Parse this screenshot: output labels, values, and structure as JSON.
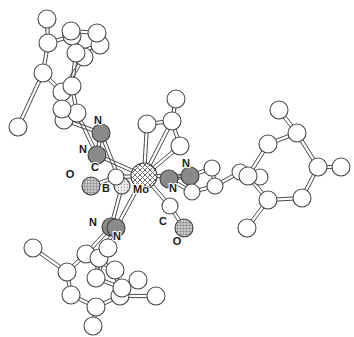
{
  "figure": {
    "kind": "molecular-structure-diagram",
    "style": "ball-and-stick crystal structure",
    "background_color": "#ffffff",
    "bond_color": "#4a4a4a",
    "width": 354,
    "height": 337
  },
  "legend": {
    "atom_types": [
      {
        "element": "Mo",
        "fill_pattern": "cross-hatch",
        "color": "#ffffff",
        "radius": 13
      },
      {
        "element": "N",
        "fill_pattern": "solid",
        "color": "#8a8a8a",
        "radius": 9
      },
      {
        "element": "O",
        "fill_pattern": "fine-grid",
        "color": "#b0b0b0",
        "radius": 9
      },
      {
        "element": "B",
        "fill_pattern": "stipple",
        "color": "#dcdcdc",
        "radius": 8
      },
      {
        "element": "C",
        "fill_pattern": "open",
        "color": "#ffffff",
        "radius": 8
      }
    ]
  },
  "labels": [
    {
      "id": "lbl-n-top-a",
      "text": "N",
      "x": 98,
      "y": 124
    },
    {
      "id": "lbl-n-top-b",
      "text": "N",
      "x": 83,
      "y": 153
    },
    {
      "id": "lbl-o-left",
      "text": "O",
      "x": 70,
      "y": 178
    },
    {
      "id": "lbl-c-left",
      "text": "C",
      "x": 95,
      "y": 171
    },
    {
      "id": "lbl-b-boron",
      "text": "B",
      "x": 106,
      "y": 192
    },
    {
      "id": "lbl-mo-center",
      "text": "Mo",
      "x": 141,
      "y": 193
    },
    {
      "id": "lbl-n-right-a",
      "text": "N",
      "x": 186,
      "y": 167
    },
    {
      "id": "lbl-n-right-b",
      "text": "N",
      "x": 173,
      "y": 192
    },
    {
      "id": "lbl-n-bot-a",
      "text": "N",
      "x": 93,
      "y": 226
    },
    {
      "id": "lbl-n-bot-b",
      "text": "N",
      "x": 117,
      "y": 240
    },
    {
      "id": "lbl-c-bot",
      "text": "C",
      "x": 163,
      "y": 225
    },
    {
      "id": "lbl-o-bot",
      "text": "O",
      "x": 177,
      "y": 245
    }
  ],
  "atoms": [
    {
      "id": "Mo1",
      "el": "Mo",
      "x": 144,
      "y": 176,
      "r": 13
    },
    {
      "id": "B1",
      "el": "B",
      "x": 122,
      "y": 186,
      "r": 8
    },
    {
      "id": "N1",
      "el": "N",
      "x": 101,
      "y": 133,
      "r": 9
    },
    {
      "id": "N2",
      "el": "N",
      "x": 97,
      "y": 155,
      "r": 9
    },
    {
      "id": "N3",
      "el": "N",
      "x": 169,
      "y": 179,
      "r": 9
    },
    {
      "id": "N4",
      "el": "N",
      "x": 190,
      "y": 176,
      "r": 9
    },
    {
      "id": "N5",
      "el": "N",
      "x": 111,
      "y": 227,
      "r": 9
    },
    {
      "id": "N6",
      "el": "N",
      "x": 116,
      "y": 228,
      "r": 9
    },
    {
      "id": "C10",
      "el": "C",
      "x": 116,
      "y": 177,
      "r": 8
    },
    {
      "id": "O10",
      "el": "O",
      "x": 91,
      "y": 186,
      "r": 9
    },
    {
      "id": "C11",
      "el": "C",
      "x": 170,
      "y": 206,
      "r": 8
    },
    {
      "id": "O11",
      "el": "O",
      "x": 184,
      "y": 228,
      "r": 9
    },
    {
      "id": "Ca1",
      "el": "C",
      "x": 147,
      "y": 124,
      "r": 9
    },
    {
      "id": "Ca2",
      "el": "C",
      "x": 172,
      "y": 121,
      "r": 9
    },
    {
      "id": "Ca3",
      "el": "C",
      "x": 180,
      "y": 146,
      "r": 9
    },
    {
      "id": "Ca4",
      "el": "C",
      "x": 176,
      "y": 99,
      "r": 9
    },
    {
      "id": "Cr1",
      "el": "C",
      "x": 192,
      "y": 192,
      "r": 8
    },
    {
      "id": "Cr2",
      "el": "C",
      "x": 215,
      "y": 186,
      "r": 8
    },
    {
      "id": "Cr3",
      "el": "C",
      "x": 212,
      "y": 168,
      "r": 8
    },
    {
      "id": "Cr4",
      "el": "C",
      "x": 240,
      "y": 172,
      "r": 8
    },
    {
      "id": "Cr5",
      "el": "C",
      "x": 260,
      "y": 177,
      "r": 8
    },
    {
      "id": "Pr1",
      "el": "C",
      "x": 268,
      "y": 144,
      "r": 9
    },
    {
      "id": "Pr2",
      "el": "C",
      "x": 297,
      "y": 133,
      "r": 9
    },
    {
      "id": "Pr3",
      "el": "C",
      "x": 318,
      "y": 167,
      "r": 9
    },
    {
      "id": "Pr4",
      "el": "C",
      "x": 302,
      "y": 198,
      "r": 9
    },
    {
      "id": "Pr5",
      "el": "C",
      "x": 268,
      "y": 200,
      "r": 9
    },
    {
      "id": "Pr6",
      "el": "C",
      "x": 248,
      "y": 176,
      "r": 9
    },
    {
      "id": "Pr7",
      "el": "C",
      "x": 279,
      "y": 110,
      "r": 9
    },
    {
      "id": "Pr8",
      "el": "C",
      "x": 341,
      "y": 167,
      "r": 9
    },
    {
      "id": "Pr9",
      "el": "C",
      "x": 247,
      "y": 228,
      "r": 9
    },
    {
      "id": "Pt1",
      "el": "C",
      "x": 64,
      "y": 120,
      "r": 9
    },
    {
      "id": "Pt2",
      "el": "C",
      "x": 62,
      "y": 92,
      "r": 9
    },
    {
      "id": "Pt3",
      "el": "C",
      "x": 43,
      "y": 73,
      "r": 9
    },
    {
      "id": "Pt4",
      "el": "C",
      "x": 48,
      "y": 43,
      "r": 9
    },
    {
      "id": "Pt5",
      "el": "C",
      "x": 72,
      "y": 36,
      "r": 9
    },
    {
      "id": "Pt6",
      "el": "C",
      "x": 84,
      "y": 57,
      "r": 9
    },
    {
      "id": "Pt7",
      "el": "C",
      "x": 47,
      "y": 19,
      "r": 9
    },
    {
      "id": "Pt8",
      "el": "C",
      "x": 18,
      "y": 127,
      "r": 9
    },
    {
      "id": "Ps1",
      "el": "C",
      "x": 77,
      "y": 113,
      "r": 9
    },
    {
      "id": "Ps2",
      "el": "C",
      "x": 72,
      "y": 86,
      "r": 9
    },
    {
      "id": "Ps3",
      "el": "C",
      "x": 76,
      "y": 53,
      "r": 9
    },
    {
      "id": "Ps4",
      "el": "C",
      "x": 100,
      "y": 45,
      "r": 9
    },
    {
      "id": "Ps5",
      "el": "C",
      "x": 71,
      "y": 31,
      "r": 9
    },
    {
      "id": "Ps6",
      "el": "C",
      "x": 97,
      "y": 33,
      "r": 9
    },
    {
      "id": "Ps7",
      "el": "C",
      "x": 62,
      "y": 109,
      "r": 9
    },
    {
      "id": "Pb1",
      "el": "C",
      "x": 86,
      "y": 254,
      "r": 9
    },
    {
      "id": "Pb2",
      "el": "C",
      "x": 67,
      "y": 272,
      "r": 9
    },
    {
      "id": "Pb3",
      "el": "C",
      "x": 71,
      "y": 295,
      "r": 9
    },
    {
      "id": "Pb4",
      "el": "C",
      "x": 96,
      "y": 307,
      "r": 9
    },
    {
      "id": "Pb5",
      "el": "C",
      "x": 120,
      "y": 296,
      "r": 9
    },
    {
      "id": "Pb6",
      "el": "C",
      "x": 115,
      "y": 270,
      "r": 9
    },
    {
      "id": "Pb7",
      "el": "C",
      "x": 33,
      "y": 248,
      "r": 9
    },
    {
      "id": "Pb8",
      "el": "C",
      "x": 93,
      "y": 326,
      "r": 9
    },
    {
      "id": "Pb9",
      "el": "C",
      "x": 156,
      "y": 296,
      "r": 9
    },
    {
      "id": "Pc1",
      "el": "C",
      "x": 99,
      "y": 258,
      "r": 9
    },
    {
      "id": "Pc2",
      "el": "C",
      "x": 96,
      "y": 278,
      "r": 9
    },
    {
      "id": "Pc3",
      "el": "C",
      "x": 122,
      "y": 288,
      "r": 9
    },
    {
      "id": "Pc4",
      "el": "C",
      "x": 138,
      "y": 280,
      "r": 9
    },
    {
      "id": "Pc5",
      "el": "C",
      "x": 108,
      "y": 248,
      "r": 9
    }
  ],
  "bonds": [
    [
      "Mo1",
      "N2"
    ],
    [
      "Mo1",
      "N4"
    ],
    [
      "Mo1",
      "N6"
    ],
    [
      "Mo1",
      "C10"
    ],
    [
      "Mo1",
      "C11"
    ],
    [
      "Mo1",
      "Ca1"
    ],
    [
      "Mo1",
      "Ca2"
    ],
    [
      "Mo1",
      "Ca3"
    ],
    [
      "B1",
      "N1"
    ],
    [
      "B1",
      "N5"
    ],
    [
      "B1",
      "C10"
    ],
    [
      "N1",
      "N2"
    ],
    [
      "N3",
      "N4"
    ],
    [
      "N5",
      "N6"
    ],
    [
      "C10",
      "O10"
    ],
    [
      "C11",
      "O11"
    ],
    [
      "Ca1",
      "Ca2"
    ],
    [
      "Ca2",
      "Ca3"
    ],
    [
      "Ca2",
      "Ca4"
    ],
    [
      "N3",
      "Cr1"
    ],
    [
      "N4",
      "Cr3"
    ],
    [
      "Cr1",
      "Cr2"
    ],
    [
      "Cr2",
      "Cr3"
    ],
    [
      "Cr2",
      "Cr4"
    ],
    [
      "Cr4",
      "Cr5"
    ],
    [
      "Cr5",
      "Pr6"
    ],
    [
      "Pr1",
      "Pr2"
    ],
    [
      "Pr2",
      "Pr3"
    ],
    [
      "Pr3",
      "Pr4"
    ],
    [
      "Pr4",
      "Pr5"
    ],
    [
      "Pr5",
      "Pr6"
    ],
    [
      "Pr6",
      "Pr1"
    ],
    [
      "Pr2",
      "Pr7"
    ],
    [
      "Pr3",
      "Pr8"
    ],
    [
      "Pr5",
      "Pr9"
    ],
    [
      "N1",
      "Pt1"
    ],
    [
      "Pt1",
      "Pt2"
    ],
    [
      "Pt2",
      "Pt3"
    ],
    [
      "Pt3",
      "Pt4"
    ],
    [
      "Pt4",
      "Pt5"
    ],
    [
      "Pt5",
      "Pt6"
    ],
    [
      "Pt6",
      "Pt2"
    ],
    [
      "Pt4",
      "Pt7"
    ],
    [
      "Pt3",
      "Pt8"
    ],
    [
      "N2",
      "Ps1"
    ],
    [
      "Ps1",
      "Ps2"
    ],
    [
      "Ps2",
      "Ps3"
    ],
    [
      "Ps3",
      "Ps4"
    ],
    [
      "Ps4",
      "Ps6"
    ],
    [
      "Ps6",
      "Ps5"
    ],
    [
      "Ps5",
      "Ps3"
    ],
    [
      "Ps1",
      "Ps7"
    ],
    [
      "N5",
      "Pb1"
    ],
    [
      "Pb1",
      "Pb2"
    ],
    [
      "Pb2",
      "Pb3"
    ],
    [
      "Pb3",
      "Pb4"
    ],
    [
      "Pb4",
      "Pb5"
    ],
    [
      "Pb5",
      "Pb6"
    ],
    [
      "Pb6",
      "Pb1"
    ],
    [
      "Pb2",
      "Pb7"
    ],
    [
      "Pb4",
      "Pb8"
    ],
    [
      "Pb5",
      "Pb9"
    ],
    [
      "N6",
      "Pc1"
    ],
    [
      "Pc1",
      "Pc2"
    ],
    [
      "Pc2",
      "Pc3"
    ],
    [
      "Pc3",
      "Pc4"
    ],
    [
      "Pc1",
      "Pc5"
    ],
    [
      "Pc5",
      "Pc2"
    ]
  ]
}
